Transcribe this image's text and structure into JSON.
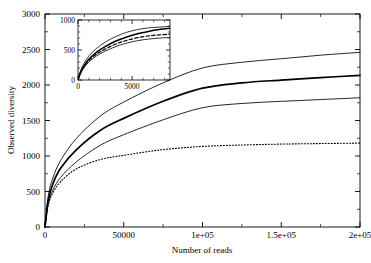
{
  "chart_data": {
    "type": "line",
    "title": "",
    "xlabel": "Number of reads",
    "ylabel": "Observed diversity",
    "xlim": [
      0,
      200000
    ],
    "ylim": [
      0,
      3000
    ],
    "grid": false,
    "legend": "none",
    "xticks": [
      0,
      50000,
      100000,
      150000,
      200000
    ],
    "xticklabels": [
      "0",
      "50000",
      "1e+05",
      "1.5e+05",
      "2e+05"
    ],
    "yticks": [
      0,
      500,
      1000,
      1500,
      2000,
      2500,
      3000
    ],
    "yticklabels": [
      "0",
      "500",
      "1000",
      "1500",
      "2000",
      "2500",
      "3000"
    ],
    "minor_ticks": true,
    "series": [
      {
        "name": "upper-confidence-bound",
        "style": "solid-thin",
        "x": [
          0,
          2000,
          5000,
          10000,
          20000,
          35000,
          50000,
          75000,
          100000,
          125000,
          150000,
          175000,
          200000
        ],
        "values": [
          0,
          430,
          690,
          940,
          1250,
          1560,
          1760,
          2030,
          2240,
          2320,
          2370,
          2420,
          2460
        ]
      },
      {
        "name": "estimated-diversity",
        "style": "solid-bold",
        "x": [
          0,
          2000,
          5000,
          10000,
          20000,
          35000,
          50000,
          75000,
          100000,
          125000,
          150000,
          175000,
          200000
        ],
        "values": [
          0,
          370,
          610,
          830,
          1090,
          1360,
          1530,
          1770,
          1955,
          2030,
          2070,
          2105,
          2135
        ]
      },
      {
        "name": "lower-confidence-bound",
        "style": "solid-thin",
        "x": [
          0,
          2000,
          5000,
          10000,
          20000,
          35000,
          50000,
          75000,
          100000,
          125000,
          150000,
          175000,
          200000
        ],
        "values": [
          0,
          320,
          520,
          700,
          920,
          1150,
          1300,
          1510,
          1680,
          1740,
          1770,
          1795,
          1820
        ]
      },
      {
        "name": "observed-rarefaction",
        "style": "dotted",
        "x": [
          0,
          2000,
          5000,
          10000,
          20000,
          35000,
          50000,
          75000,
          100000,
          125000,
          150000,
          175000,
          200000
        ],
        "values": [
          0,
          300,
          480,
          640,
          820,
          950,
          1010,
          1090,
          1135,
          1155,
          1168,
          1175,
          1182
        ]
      }
    ]
  },
  "inset_chart_data": {
    "type": "line",
    "title": "",
    "xlabel": "",
    "ylabel": "",
    "xlim": [
      0,
      8500
    ],
    "ylim": [
      0,
      1000
    ],
    "grid": false,
    "legend": "none",
    "xticks": [
      0,
      5000
    ],
    "xticklabels": [
      "0",
      "5000"
    ],
    "yticks": [
      0,
      500,
      1000
    ],
    "yticklabels": [
      "0",
      "500",
      "1000"
    ],
    "minor_ticks": true,
    "series": [
      {
        "name": "inset-upper-confidence-bound",
        "style": "solid-thin",
        "x": [
          0,
          200,
          500,
          1000,
          1700,
          2500,
          3500,
          4500,
          5500,
          6500,
          7500,
          8500
        ],
        "values": [
          0,
          135,
          260,
          400,
          525,
          630,
          725,
          795,
          840,
          868,
          882,
          893
        ]
      },
      {
        "name": "inset-estimated-diversity",
        "style": "solid-bold",
        "x": [
          0,
          200,
          500,
          1000,
          1700,
          2500,
          3500,
          4500,
          5500,
          6500,
          7500,
          8500
        ],
        "values": [
          0,
          110,
          220,
          345,
          460,
          555,
          650,
          718,
          772,
          810,
          840,
          862
        ]
      },
      {
        "name": "inset-observed-rarefaction",
        "style": "dashed",
        "x": [
          0,
          200,
          500,
          1000,
          1700,
          2500,
          3500,
          4500,
          5500,
          6500,
          7500,
          8500
        ],
        "values": [
          0,
          105,
          208,
          325,
          430,
          515,
          600,
          660,
          705,
          735,
          752,
          765
        ]
      },
      {
        "name": "inset-lower-confidence-bound",
        "style": "solid-thin",
        "x": [
          0,
          200,
          500,
          1000,
          1700,
          2500,
          3500,
          4500,
          5500,
          6500,
          7500,
          8500
        ],
        "values": [
          0,
          95,
          190,
          300,
          400,
          480,
          558,
          615,
          655,
          682,
          698,
          708
        ]
      }
    ]
  }
}
